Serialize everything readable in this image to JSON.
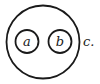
{
  "diagram": {
    "type": "nested-sets",
    "outer_set": {
      "label": "c."
    },
    "inner_sets": [
      {
        "label": "a"
      },
      {
        "label": "b"
      }
    ],
    "stroke_color": "#1a1a1a",
    "background": "#ffffff"
  }
}
